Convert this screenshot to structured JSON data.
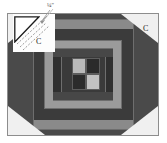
{
  "diagram": {
    "type": "log-cabin-quilt-block",
    "seam_note": "¼\"",
    "corner_patch_label": "C",
    "corner_patch_label_2": "C",
    "colors": {
      "background": "#ffffff",
      "frame_border": "#8d8d8d",
      "frame_fill": "#f2f2f2",
      "octagon_dark": "#4a4a4a",
      "ring_1_light_gray": "#8a8a8a",
      "ring_2_dark": "#3b3b3b",
      "ring_3_mid_gray": "#9b9b9b",
      "ring_4_dark_gray": "#474747",
      "ring_5_darkest": "#2f2f2f",
      "center_light": "#b9b9b9",
      "center_dark": "#2b2b2b",
      "corner_patch": "#f0f0f0",
      "callout_fill": "#fdfdfd",
      "seam_line": "#8a8a8a",
      "outline": "#1c1c1c"
    },
    "rings": [
      {
        "name": "outer-border-light",
        "fill": "#8a8a8a"
      },
      {
        "name": "round-2-dark",
        "fill": "#3b3b3b"
      },
      {
        "name": "round-3-mid",
        "fill": "#9b9b9b"
      },
      {
        "name": "round-4-dark",
        "fill": "#474747"
      },
      {
        "name": "round-5-darkest",
        "fill": "#2f2f2f"
      }
    ],
    "center_checker": [
      {
        "position": "top-left",
        "fill": "#b9b9b9",
        "value": "light"
      },
      {
        "position": "top-right",
        "fill": "#2b2b2b",
        "value": "dark"
      },
      {
        "position": "bottom-left",
        "fill": "#2b2b2b",
        "value": "dark"
      },
      {
        "position": "bottom-right",
        "fill": "#c2c2c2",
        "value": "light"
      }
    ],
    "corner_patches": [
      {
        "position": "top-left",
        "label": "C"
      },
      {
        "position": "top-right",
        "label": "C"
      },
      {
        "position": "bottom-left",
        "label": ""
      },
      {
        "position": "bottom-right",
        "label": ""
      }
    ]
  }
}
